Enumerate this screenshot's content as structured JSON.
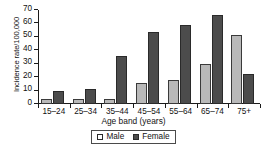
{
  "chart_data": {
    "type": "bar",
    "title": "",
    "xlabel": "Age band (years)",
    "ylabel": "Incidence rate/100,000",
    "categories": [
      "15–24",
      "25–34",
      "35–44",
      "45–54",
      "55–64",
      "65–74",
      "75+"
    ],
    "series": [
      {
        "name": "Male",
        "color": "#b9b9b9",
        "values": [
          4,
          3.5,
          3.5,
          16,
          18,
          30,
          51.5
        ]
      },
      {
        "name": "Female",
        "color": "#4c4c4c",
        "values": [
          9.5,
          11.5,
          36,
          54,
          59,
          66,
          22.5
        ]
      }
    ],
    "ylim": [
      0,
      70
    ],
    "ytick_labels": [
      "0",
      "10",
      "20",
      "30",
      "40",
      "50",
      "60",
      "70"
    ],
    "ytick_values": [
      0,
      10,
      20,
      30,
      40,
      50,
      60,
      70
    ],
    "grid": false,
    "legend_position": "bottom-center",
    "legend_entries": [
      "Male",
      "Female"
    ]
  }
}
